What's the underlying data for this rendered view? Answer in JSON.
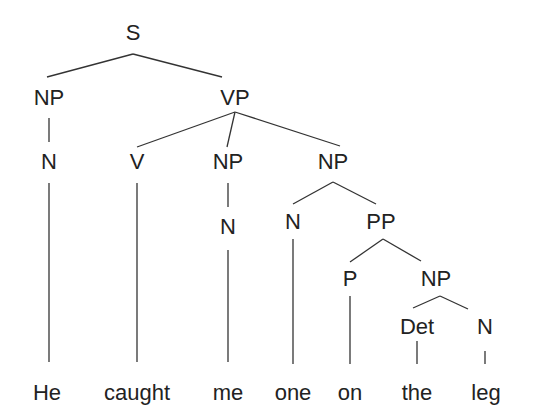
{
  "tree": {
    "title": "Syntax tree",
    "nodes": [
      {
        "id": "S",
        "label": "S",
        "x": 133,
        "y": 40
      },
      {
        "id": "NP1",
        "label": "NP",
        "x": 49,
        "y": 105
      },
      {
        "id": "VP",
        "label": "VP",
        "x": 235,
        "y": 105
      },
      {
        "id": "N1",
        "label": "N",
        "x": 49,
        "y": 169
      },
      {
        "id": "V",
        "label": "V",
        "x": 137,
        "y": 169
      },
      {
        "id": "NP2",
        "label": "NP",
        "x": 228,
        "y": 169
      },
      {
        "id": "NP3",
        "label": "NP",
        "x": 333,
        "y": 169
      },
      {
        "id": "N2",
        "label": "N",
        "x": 228,
        "y": 234
      },
      {
        "id": "N3",
        "label": "N",
        "x": 293,
        "y": 229
      },
      {
        "id": "PP",
        "label": "PP",
        "x": 381,
        "y": 229
      },
      {
        "id": "P",
        "label": "P",
        "x": 350,
        "y": 286
      },
      {
        "id": "NP4",
        "label": "NP",
        "x": 436,
        "y": 286
      },
      {
        "id": "Det",
        "label": "Det",
        "x": 417,
        "y": 334
      },
      {
        "id": "N4",
        "label": "N",
        "x": 485,
        "y": 334
      }
    ],
    "words": [
      {
        "label": "He",
        "x": 47
      },
      {
        "label": "caught",
        "x": 137
      },
      {
        "label": "me",
        "x": 228
      },
      {
        "label": "one",
        "x": 293
      },
      {
        "label": "on",
        "x": 350
      },
      {
        "label": "the",
        "x": 417
      },
      {
        "label": "leg",
        "x": 486
      }
    ],
    "word_y": 400,
    "edges": [
      [
        133,
        54,
        47,
        77
      ],
      [
        133,
        54,
        222,
        77
      ],
      [
        49,
        118,
        49,
        142
      ],
      [
        235,
        112,
        137,
        147
      ],
      [
        235,
        112,
        227,
        147
      ],
      [
        235,
        112,
        340,
        146
      ],
      [
        49,
        183,
        49,
        362
      ],
      [
        137,
        183,
        137,
        362
      ],
      [
        228,
        183,
        228,
        207
      ],
      [
        228,
        250,
        228,
        362
      ],
      [
        333,
        182,
        293,
        204
      ],
      [
        333,
        182,
        376,
        204
      ],
      [
        293,
        239,
        293,
        364
      ],
      [
        383,
        239,
        350,
        262
      ],
      [
        383,
        239,
        421,
        261
      ],
      [
        350,
        296,
        350,
        364
      ],
      [
        440,
        296,
        413,
        308
      ],
      [
        440,
        296,
        468,
        309
      ],
      [
        417,
        341,
        417,
        364
      ],
      [
        485,
        351,
        485,
        364
      ]
    ]
  }
}
